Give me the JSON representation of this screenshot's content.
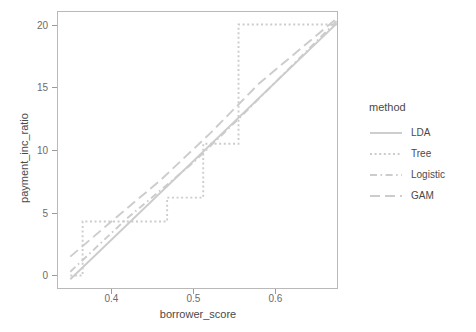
{
  "chart_data": {
    "type": "line",
    "title": "",
    "xlabel": "borrower_score",
    "ylabel": "payment_inc_ratio",
    "xlim": [
      0.335,
      0.675
    ],
    "ylim": [
      -1.0,
      21.0
    ],
    "xticks": [
      0.4,
      0.5,
      0.6
    ],
    "xtick_labels": [
      "0.4",
      "0.5",
      "0.6"
    ],
    "yticks": [
      0,
      5,
      10,
      15,
      20
    ],
    "ytick_labels": [
      "0",
      "5",
      "10",
      "15",
      "20"
    ],
    "grid": false,
    "legend_position": "right",
    "legend_title": "method",
    "line_color": "#cccccc",
    "panel_border_color": "#b9b9b9",
    "series": [
      {
        "name": "LDA",
        "dash": "solid",
        "points": [
          [
            0.35,
            -0.3
          ],
          [
            0.675,
            20.1
          ]
        ]
      },
      {
        "name": "Tree",
        "dash": "dotted",
        "points": [
          [
            0.35,
            0.0
          ],
          [
            0.365,
            0.0
          ],
          [
            0.365,
            4.3
          ],
          [
            0.468,
            4.3
          ],
          [
            0.468,
            6.2
          ],
          [
            0.512,
            6.2
          ],
          [
            0.512,
            10.5
          ],
          [
            0.555,
            10.5
          ],
          [
            0.555,
            20.0
          ],
          [
            0.675,
            20.0
          ]
        ]
      },
      {
        "name": "Logistic",
        "dash": "dashdot",
        "points": [
          [
            0.35,
            0.3
          ],
          [
            0.42,
            4.6
          ],
          [
            0.5,
            9.0
          ],
          [
            0.56,
            12.8
          ],
          [
            0.675,
            20.3
          ]
        ]
      },
      {
        "name": "GAM",
        "dash": "longdash",
        "points": [
          [
            0.35,
            1.5
          ],
          [
            0.4,
            4.3
          ],
          [
            0.46,
            7.6
          ],
          [
            0.52,
            11.3
          ],
          [
            0.58,
            15.3
          ],
          [
            0.675,
            20.5
          ]
        ]
      }
    ]
  },
  "legend": {
    "title": "method",
    "items": [
      {
        "label": "LDA",
        "key": "solid-line-key"
      },
      {
        "label": "Tree",
        "key": "dotted-line-key"
      },
      {
        "label": "Logistic",
        "key": "dashdot-line-key"
      },
      {
        "label": "GAM",
        "key": "longdash-line-key"
      }
    ]
  }
}
